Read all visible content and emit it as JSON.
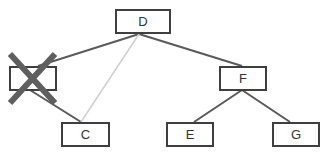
{
  "diagram": {
    "type": "binary-tree",
    "nodes": [
      {
        "id": "D",
        "label": "D",
        "x": 115,
        "y": 9,
        "w": 56,
        "h": 25,
        "deleted": false
      },
      {
        "id": "B",
        "label": "",
        "x": 9,
        "y": 66,
        "w": 48,
        "h": 25,
        "deleted": true
      },
      {
        "id": "F",
        "label": "F",
        "x": 219,
        "y": 66,
        "w": 48,
        "h": 25,
        "deleted": false
      },
      {
        "id": "C",
        "label": "C",
        "x": 61,
        "y": 122,
        "w": 49,
        "h": 25,
        "deleted": false
      },
      {
        "id": "E",
        "label": "E",
        "x": 166,
        "y": 122,
        "w": 48,
        "h": 25,
        "deleted": false
      },
      {
        "id": "G",
        "label": "G",
        "x": 272,
        "y": 122,
        "w": 48,
        "h": 25,
        "deleted": false
      }
    ],
    "edges": [
      {
        "from": "D",
        "to": "B",
        "style": "solid"
      },
      {
        "from": "D",
        "to": "F",
        "style": "solid"
      },
      {
        "from": "B",
        "to": "C",
        "style": "solid"
      },
      {
        "from": "D",
        "to": "C",
        "style": "light"
      },
      {
        "from": "F",
        "to": "E",
        "style": "solid"
      },
      {
        "from": "F",
        "to": "G",
        "style": "solid"
      }
    ],
    "colors": {
      "edge": "#5a5a5a",
      "light_edge": "#cfcfcf",
      "cross": "#5f5f5f",
      "border": "#3f3f3f"
    }
  }
}
